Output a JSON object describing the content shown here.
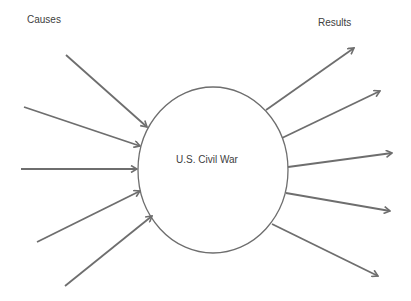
{
  "diagram": {
    "causes_label": "Causes",
    "results_label": "Results",
    "center_label": "U.S. Civil War",
    "stroke_color": "#6e6e6e",
    "center": {
      "cx": 213,
      "cy": 170,
      "rx": 75,
      "ry": 83
    },
    "cause_arrows": [
      {
        "x1": 66,
        "y1": 55,
        "x2": 147,
        "y2": 127
      },
      {
        "x1": 24,
        "y1": 107,
        "x2": 140,
        "y2": 146
      },
      {
        "x1": 21,
        "y1": 169,
        "x2": 137,
        "y2": 169
      },
      {
        "x1": 37,
        "y1": 242,
        "x2": 140,
        "y2": 191
      },
      {
        "x1": 65,
        "y1": 286,
        "x2": 152,
        "y2": 216
      }
    ],
    "result_arrows": [
      {
        "x1": 266,
        "y1": 110,
        "x2": 354,
        "y2": 48
      },
      {
        "x1": 282,
        "y1": 138,
        "x2": 380,
        "y2": 91
      },
      {
        "x1": 288,
        "y1": 167,
        "x2": 392,
        "y2": 153
      },
      {
        "x1": 286,
        "y1": 193,
        "x2": 390,
        "y2": 211
      },
      {
        "x1": 272,
        "y1": 224,
        "x2": 378,
        "y2": 276
      }
    ]
  }
}
